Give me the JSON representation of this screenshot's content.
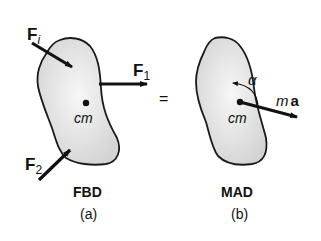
{
  "panel_a": {
    "force_i": "F",
    "force_i_sub": "i",
    "force_1": "F",
    "force_1_sub": "1",
    "force_2": "F",
    "force_2_sub": "2",
    "center_label": "cm",
    "title": "FBD",
    "caption": "(a)"
  },
  "equals": "=",
  "panel_b": {
    "alpha": "α",
    "accel_m": "m",
    "accel_a": "a",
    "center_label": "cm",
    "title": "MAD",
    "caption": "(b)"
  },
  "colors": {
    "body_fill": "#e4e4e4",
    "outline": "#1a1a1a"
  }
}
